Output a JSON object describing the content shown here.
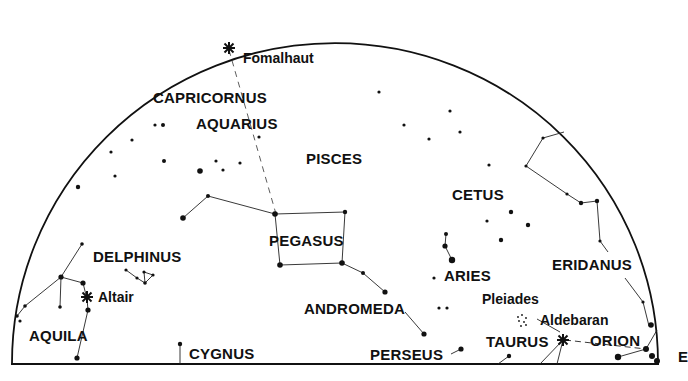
{
  "map": {
    "type": "star-chart",
    "horizon_direction_label": "E",
    "colors": {
      "ink": "#111111",
      "background": "#ffffff"
    },
    "constellations": [
      {
        "name": "CAPRICORNUS",
        "x": 153,
        "y": 90
      },
      {
        "name": "AQUARIUS",
        "x": 196,
        "y": 116
      },
      {
        "name": "PISCES",
        "x": 306,
        "y": 151
      },
      {
        "name": "CETUS",
        "x": 452,
        "y": 187
      },
      {
        "name": "PEGASUS",
        "x": 269,
        "y": 233
      },
      {
        "name": "DELPHINUS",
        "x": 93,
        "y": 249
      },
      {
        "name": "ERIDANUS",
        "x": 552,
        "y": 257
      },
      {
        "name": "ARIES",
        "x": 444,
        "y": 268
      },
      {
        "name": "ANDROMEDA",
        "x": 304,
        "y": 301
      },
      {
        "name": "AQUILA",
        "x": 29,
        "y": 328
      },
      {
        "name": "TAURUS",
        "x": 486,
        "y": 334
      },
      {
        "name": "ORION",
        "x": 590,
        "y": 333
      },
      {
        "name": "CYGNUS",
        "x": 189,
        "y": 346
      },
      {
        "name": "PERSEUS",
        "x": 370,
        "y": 347
      }
    ],
    "named_stars": [
      {
        "name": "Fomalhaut",
        "x": 243,
        "y": 51
      },
      {
        "name": "Altair",
        "x": 98,
        "y": 290
      },
      {
        "name": "Pleiades",
        "x": 482,
        "y": 292
      },
      {
        "name": "Aldebaran",
        "x": 540,
        "y": 313
      }
    ]
  }
}
